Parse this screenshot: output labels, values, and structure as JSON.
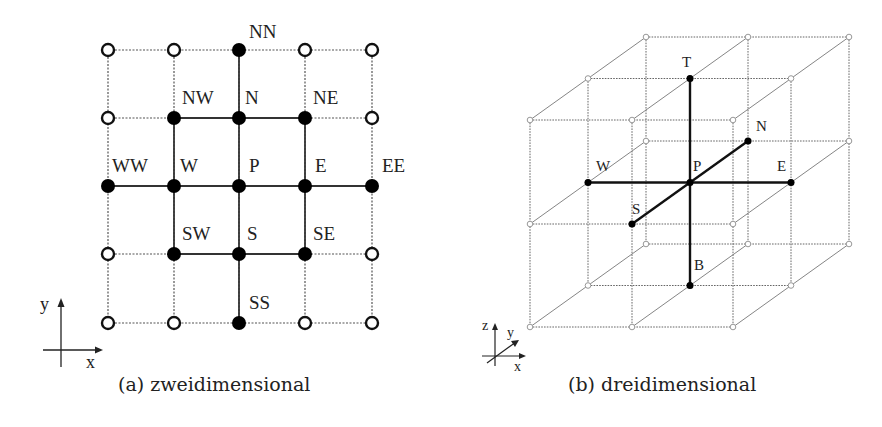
{
  "figure_2d": {
    "caption": "(a) zweidimensional",
    "axes": {
      "x_label": "x",
      "y_label": "y"
    },
    "grid": {
      "cols_x": [
        108,
        174,
        239,
        305,
        372
      ],
      "rows_y": [
        50,
        118,
        186,
        254,
        323
      ]
    },
    "nodes": [
      {
        "id": "NN",
        "col": 2,
        "row": 0,
        "filled": true,
        "label": "NN",
        "dx": 10,
        "dy": -12
      },
      {
        "id": "NW",
        "col": 1,
        "row": 1,
        "filled": true,
        "label": "NW",
        "dx": 8,
        "dy": -14
      },
      {
        "id": "N",
        "col": 2,
        "row": 1,
        "filled": true,
        "label": "N",
        "dx": 6,
        "dy": -14
      },
      {
        "id": "NE",
        "col": 3,
        "row": 1,
        "filled": true,
        "label": "NE",
        "dx": 8,
        "dy": -14
      },
      {
        "id": "WW",
        "col": 0,
        "row": 2,
        "filled": true,
        "label": "WW",
        "dx": 4,
        "dy": -14
      },
      {
        "id": "W",
        "col": 1,
        "row": 2,
        "filled": true,
        "label": "W",
        "dx": 6,
        "dy": -14
      },
      {
        "id": "P",
        "col": 2,
        "row": 2,
        "filled": true,
        "label": "P",
        "dx": 10,
        "dy": -14
      },
      {
        "id": "E",
        "col": 3,
        "row": 2,
        "filled": true,
        "label": "E",
        "dx": 10,
        "dy": -14
      },
      {
        "id": "EE",
        "col": 4,
        "row": 2,
        "filled": true,
        "label": "EE",
        "dx": 10,
        "dy": -14
      },
      {
        "id": "SW",
        "col": 1,
        "row": 3,
        "filled": true,
        "label": "SW",
        "dx": 8,
        "dy": -14
      },
      {
        "id": "S",
        "col": 2,
        "row": 3,
        "filled": true,
        "label": "S",
        "dx": 8,
        "dy": -14
      },
      {
        "id": "SE",
        "col": 3,
        "row": 3,
        "filled": true,
        "label": "SE",
        "dx": 8,
        "dy": -14
      },
      {
        "id": "SS",
        "col": 2,
        "row": 4,
        "filled": true,
        "label": "SS",
        "dx": 10,
        "dy": -14
      }
    ],
    "solid_edges": [
      [
        "NN",
        "N"
      ],
      [
        "NW",
        "N"
      ],
      [
        "N",
        "NE"
      ],
      [
        "N",
        "P"
      ],
      [
        "NW",
        "W"
      ],
      [
        "NE",
        "E"
      ],
      [
        "WW",
        "W"
      ],
      [
        "W",
        "P"
      ],
      [
        "P",
        "E"
      ],
      [
        "E",
        "EE"
      ],
      [
        "W",
        "SW"
      ],
      [
        "E",
        "SE"
      ],
      [
        "P",
        "S"
      ],
      [
        "SW",
        "S"
      ],
      [
        "S",
        "SE"
      ],
      [
        "S",
        "SS"
      ]
    ]
  },
  "figure_3d": {
    "caption": "(b) dreidimensional",
    "axes": {
      "x_label": "x",
      "y_label": "y",
      "z_label": "z"
    },
    "layers": {
      "cols_x": [
        530,
        632,
        733
      ],
      "rows_y": [
        120,
        224,
        327
      ],
      "depth_offset": [
        58,
        -41.5
      ]
    },
    "center_label": "P",
    "neighbors": [
      {
        "id": "W",
        "label": "W"
      },
      {
        "id": "E",
        "label": "E"
      },
      {
        "id": "N",
        "label": "N"
      },
      {
        "id": "S",
        "label": "S"
      },
      {
        "id": "T",
        "label": "T"
      },
      {
        "id": "B",
        "label": "B"
      }
    ]
  }
}
